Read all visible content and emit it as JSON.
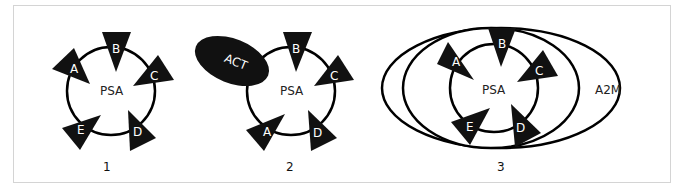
{
  "figure": {
    "panels": [
      {
        "number": "1",
        "center_label": "PSA",
        "binding_sites": [
          "A",
          "B",
          "C",
          "D",
          "E"
        ]
      },
      {
        "number": "2",
        "center_label": "PSA",
        "binding_sites": [
          "A",
          "B",
          "C",
          "D"
        ],
        "complex_partner": "ACT"
      },
      {
        "number": "3",
        "center_label": "PSA",
        "binding_sites": [
          "A",
          "B",
          "C",
          "D",
          "E"
        ],
        "complex_partner": "A2M"
      }
    ],
    "colors": {
      "stroke": "#000000",
      "fill": "#111111",
      "label_on_dark": "#ffffff",
      "frame": "#d4d4d4"
    }
  }
}
